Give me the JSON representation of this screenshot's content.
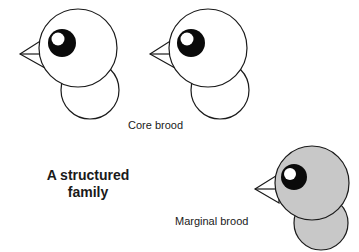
{
  "diagram": {
    "title_line1": "A structured",
    "title_line2": "family",
    "groups": [
      {
        "label": "Core brood",
        "fill": "#ffffff",
        "birds": 2
      },
      {
        "label": "Marginal brood",
        "fill": "#c8c8c8",
        "birds": 1
      }
    ],
    "colors": {
      "stroke": "#1a1a1a",
      "eye": "#0a0a0a",
      "highlight": "#ffffff",
      "core_fill": "#ffffff",
      "marginal_fill": "#c8c8c8"
    }
  }
}
